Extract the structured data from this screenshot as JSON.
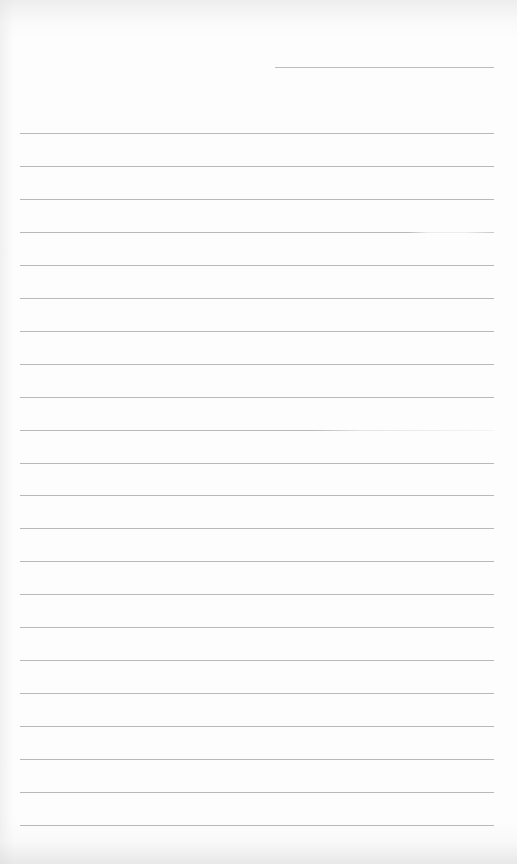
{
  "document": {
    "type": "lined-paper",
    "header": {
      "name_line_text": ""
    },
    "rule_count": 22,
    "line_color": "#b9b9b9",
    "paper_color": "#fdfdfd",
    "lines": [
      {
        "text": ""
      },
      {
        "text": ""
      },
      {
        "text": ""
      },
      {
        "text": "",
        "style": "faded-right"
      },
      {
        "text": ""
      },
      {
        "text": ""
      },
      {
        "text": ""
      },
      {
        "text": ""
      },
      {
        "text": ""
      },
      {
        "text": "",
        "style": "faded"
      },
      {
        "text": ""
      },
      {
        "text": ""
      },
      {
        "text": ""
      },
      {
        "text": ""
      },
      {
        "text": ""
      },
      {
        "text": ""
      },
      {
        "text": ""
      },
      {
        "text": ""
      },
      {
        "text": ""
      },
      {
        "text": ""
      },
      {
        "text": ""
      },
      {
        "text": ""
      }
    ]
  }
}
